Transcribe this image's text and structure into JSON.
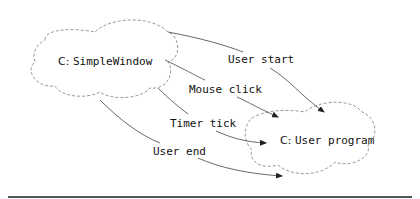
{
  "diagram": {
    "nodes": [
      {
        "id": "simple-window",
        "prefix": "C:",
        "name": "SimpleWindow"
      },
      {
        "id": "user-program",
        "prefix": "C:",
        "name": "User program"
      }
    ],
    "edges": [
      {
        "label": "User start",
        "from": "simple-window",
        "to": "user-program"
      },
      {
        "label": "Mouse click",
        "from": "simple-window",
        "to": "user-program"
      },
      {
        "label": "Timer tick",
        "from": "simple-window",
        "to": "user-program"
      },
      {
        "label": "User end",
        "from": "simple-window",
        "to": "user-program"
      }
    ],
    "colors": {
      "cloud_stroke": "#999999",
      "arrow": "#444444",
      "rule": "#555555"
    }
  }
}
